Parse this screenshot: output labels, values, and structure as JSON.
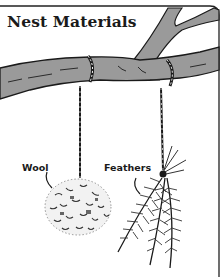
{
  "title": "Nest Materials",
  "labels": {
    "wool": "Wool",
    "feathers": "Feathers"
  },
  "colors": {
    "branch_fill": "#9a9a9a",
    "ink": "#1a1a1a",
    "background": "#ffffff"
  }
}
